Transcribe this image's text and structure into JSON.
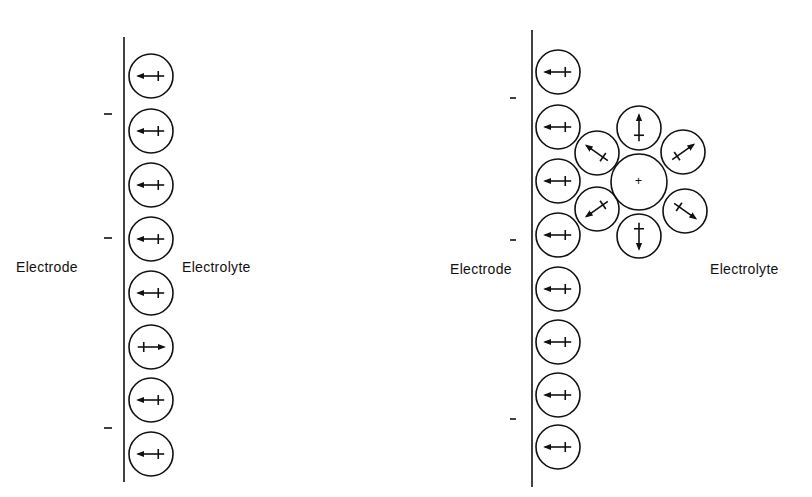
{
  "left_panel": {
    "electrode_label": "Electrode",
    "electrolyte_label": "Electrolyte",
    "charge_symbol": "−",
    "dipoles": [
      "left",
      "left",
      "left",
      "left",
      "left",
      "right",
      "left",
      "left"
    ]
  },
  "right_panel": {
    "electrode_label": "Electrode",
    "electrolyte_label": "Electrolyte",
    "charge_symbol": "−",
    "dipoles": [
      "left",
      "left",
      "left",
      "left",
      "left",
      "left",
      "left",
      "left"
    ],
    "hydrated_ion": {
      "charge": "+",
      "shell_size": 6
    }
  }
}
